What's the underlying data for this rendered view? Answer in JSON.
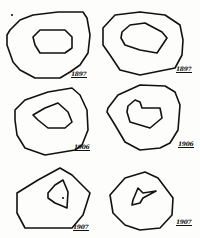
{
  "figures": [
    {
      "id": "fig-1",
      "year": "1897",
      "label_pos": {
        "left": 71,
        "top": 70
      },
      "outer": "10,30 20,20 33,15 58,12 83,12 87,18 90,35 88,53 80,65 70,72 60,78 35,78 20,70 13,62 7,45 7,35",
      "inner": "33,37 40,30 65,30 72,37 72,48 65,53 40,53 35,45"
    },
    {
      "id": "fig-2",
      "year": "1897",
      "label_pos": {
        "left": 176,
        "top": 65
      },
      "outer": "103,28 115,15 140,12 165,15 180,25 183,40 182,55 175,68 165,70 140,75 120,70 110,55 103,45",
      "inner": "122,32 130,25 145,23 162,32 167,38 157,53 140,50 125,45 121,38"
    },
    {
      "id": "fig-3",
      "year": "1906",
      "label_pos": {
        "left": 74,
        "top": 143
      },
      "outer": "15,110 25,100 48,92 72,88 80,95 87,110 88,130 82,145 75,150 45,155 25,148 17,135 15,120",
      "inner": "33,115 45,108 58,103 68,112 72,122 65,128 48,128 38,120"
    },
    {
      "id": "fig-4",
      "year": "1906",
      "label_pos": {
        "left": 178,
        "top": 140
      },
      "outer": "108,108 118,95 140,85 165,86 175,92 180,105 178,130 170,143 160,148 140,150 125,142 115,125 107,112",
      "inner": "128,106 135,100 140,102 142,108 160,108 162,118 150,128 130,122 127,112"
    },
    {
      "id": "fig-5",
      "year": "1907",
      "label_pos": {
        "left": 73,
        "top": 223
      },
      "outer": "17,193 38,180 60,168 72,175 90,193 83,215 72,228 25,228 17,213",
      "inner": "48,193 55,185 63,180 68,192 67,208 60,205 55,203 48,198"
    },
    {
      "id": "fig-6",
      "year": "1907",
      "label_pos": {
        "left": 176,
        "top": 218
      },
      "outer": "110,195 125,178 145,172 158,178 173,198 172,215 160,228 140,230 125,225 113,213",
      "inner": "133,200 138,188 143,193 156,191 143,198 140,203 132,205"
    }
  ],
  "colors": {
    "ink": "#111111",
    "paper": "#fdfdfb"
  }
}
